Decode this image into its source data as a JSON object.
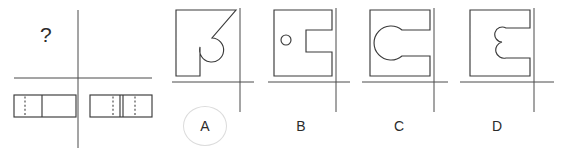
{
  "figure": {
    "type": "orthographic-projection-puzzle",
    "question_mark": "?",
    "stroke_color": "#3a3a3a",
    "background_color": "#ffffff",
    "selection_ring_color": "#dcdcdc"
  },
  "question_panel": {
    "name": "question-panel",
    "unknown_view_marker": "?",
    "crosshair": {
      "horizontal": true,
      "vertical": true
    },
    "bottom_views": [
      {
        "name": "bottom-view-left",
        "description": "rectangle with a solid vertical divider and one dashed hidden line",
        "solid_divider": true,
        "dashed_lines": 1
      },
      {
        "name": "bottom-view-right",
        "description": "rectangle with a solid vertical divider and two dashed hidden lines",
        "solid_divider": true,
        "dashed_lines": 2
      }
    ]
  },
  "options": [
    {
      "id": "A",
      "label": "A",
      "selected": true,
      "shape": "square-with-circular-notch-and-diagonal-cut",
      "crosshair": true
    },
    {
      "id": "B",
      "label": "B",
      "selected": false,
      "shape": "square-with-rectangular-slot-and-small-circle-hole",
      "crosshair": true
    },
    {
      "id": "C",
      "label": "C",
      "selected": false,
      "shape": "square-with-c-shaped-rounded-slot",
      "crosshair": true
    },
    {
      "id": "D",
      "label": "D",
      "selected": false,
      "shape": "square-with-puzzle-style-double-lobe-slot",
      "crosshair": true
    }
  ]
}
